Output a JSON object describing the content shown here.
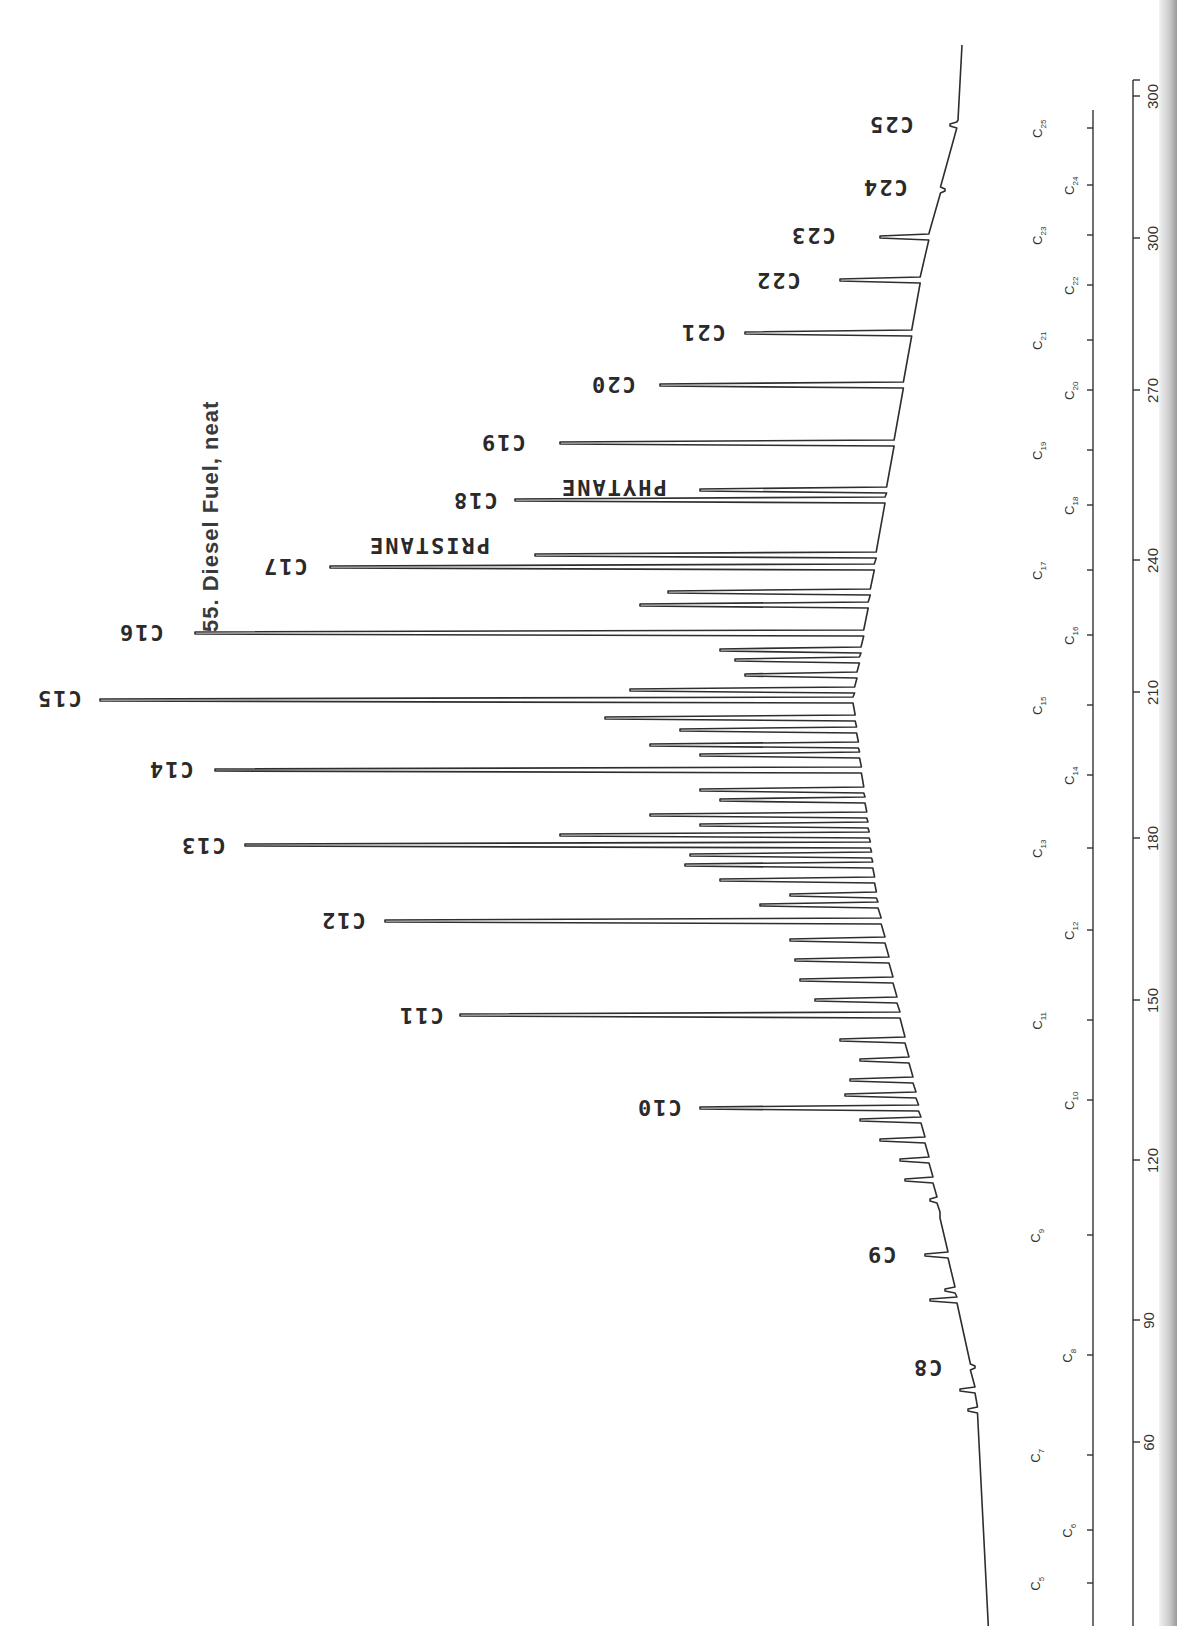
{
  "chart_data": {
    "type": "line",
    "title": "55. Diesel Fuel, neat",
    "orientation": "rotated 90° — retention axis runs vertically (bottom=early, top=late), detector response extends leftward",
    "xlabel": "Column temperature (°C) / carbon number",
    "ylabel": "Detector response",
    "temperature_ticks": [
      60,
      90,
      120,
      150,
      180,
      210,
      240,
      270,
      300,
      300
    ],
    "carbon_number_ticks": [
      "C5",
      "C6",
      "C7",
      "C8",
      "C9",
      "C10",
      "C11",
      "C12",
      "C13",
      "C14",
      "C15",
      "C16",
      "C17",
      "C18",
      "C19",
      "C20",
      "C21",
      "C22",
      "C23",
      "C24",
      "C25"
    ],
    "peaks": [
      {
        "label": "C8",
        "retention_temp": 83,
        "relative_height": 3
      },
      {
        "label": "C9",
        "retention_temp": 104,
        "relative_height": 8
      },
      {
        "label": "C10",
        "retention_temp": 124,
        "relative_height": 30
      },
      {
        "label": "C11",
        "retention_temp": 145,
        "relative_height": 56
      },
      {
        "label": "C12",
        "retention_temp": 164,
        "relative_height": 68
      },
      {
        "label": "C13",
        "retention_temp": 181,
        "relative_height": 82
      },
      {
        "label": "C14",
        "retention_temp": 196,
        "relative_height": 85
      },
      {
        "label": "C15",
        "retention_temp": 211,
        "relative_height": 100
      },
      {
        "label": "C16",
        "retention_temp": 225,
        "relative_height": 90
      },
      {
        "label": "C17",
        "retention_temp": 238,
        "relative_height": 72
      },
      {
        "label": "PRISTANE",
        "retention_temp": 240,
        "relative_height": 50
      },
      {
        "label": "C18",
        "retention_temp": 251,
        "relative_height": 48
      },
      {
        "label": "PHYTANE",
        "retention_temp": 253,
        "relative_height": 22
      },
      {
        "label": "C19",
        "retention_temp": 263,
        "relative_height": 43
      },
      {
        "label": "C20",
        "retention_temp": 275,
        "relative_height": 33
      },
      {
        "label": "C21",
        "retention_temp": 286,
        "relative_height": 22
      },
      {
        "label": "C22",
        "retention_temp": 297,
        "relative_height": 12
      },
      {
        "label": "C23",
        "retention_temp": 300,
        "relative_height": 7
      },
      {
        "label": "C24",
        "retention_temp": 300,
        "relative_height": 2
      },
      {
        "label": "C25",
        "retention_temp": 300,
        "relative_height": 1
      }
    ],
    "grid": false,
    "legend": null
  },
  "title": "55. Diesel Fuel, neat",
  "peak_labels": {
    "c8": "C8",
    "c9": "C9",
    "c10": "C10",
    "c11": "C11",
    "c12": "C12",
    "c13": "C13",
    "c14": "C14",
    "c15": "C15",
    "c16": "C16",
    "c17": "C17",
    "c18": "C18",
    "c19": "C19",
    "c20": "C20",
    "c21": "C21",
    "c22": "C22",
    "c23": "C23",
    "c24": "C24",
    "c25": "C25",
    "pristane": "PRISTANE",
    "phytane": "PHYTANE"
  },
  "carbon_axis": [
    {
      "sub": "5",
      "y": 1583,
      "col": "a"
    },
    {
      "sub": "6",
      "y": 1530,
      "col": "b"
    },
    {
      "sub": "7",
      "y": 1455,
      "col": "a"
    },
    {
      "sub": "8",
      "y": 1355,
      "col": "b"
    },
    {
      "sub": "9",
      "y": 1235,
      "col": "a"
    },
    {
      "sub": "10",
      "y": 1100,
      "col": "b"
    },
    {
      "sub": "11",
      "y": 1020,
      "col": "a"
    },
    {
      "sub": "12",
      "y": 930,
      "col": "b"
    },
    {
      "sub": "13",
      "y": 848,
      "col": "a"
    },
    {
      "sub": "14",
      "y": 775,
      "col": "b"
    },
    {
      "sub": "15",
      "y": 705,
      "col": "a"
    },
    {
      "sub": "16",
      "y": 635,
      "col": "b"
    },
    {
      "sub": "17",
      "y": 570,
      "col": "a"
    },
    {
      "sub": "18",
      "y": 505,
      "col": "b"
    },
    {
      "sub": "19",
      "y": 450,
      "col": "a"
    },
    {
      "sub": "20",
      "y": 390,
      "col": "b"
    },
    {
      "sub": "21",
      "y": 340,
      "col": "a"
    },
    {
      "sub": "22",
      "y": 285,
      "col": "b"
    },
    {
      "sub": "23",
      "y": 235,
      "col": "a"
    },
    {
      "sub": "24",
      "y": 185,
      "col": "b"
    },
    {
      "sub": "25",
      "y": 128,
      "col": "a"
    }
  ],
  "temp_axis": [
    {
      "label": "60",
      "y": 1442
    },
    {
      "label": "90",
      "y": 1320
    },
    {
      "label": "120",
      "y": 1160
    },
    {
      "label": "150",
      "y": 1000
    },
    {
      "label": "180",
      "y": 838
    },
    {
      "label": "210",
      "y": 692
    },
    {
      "label": "240",
      "y": 560
    },
    {
      "label": "270",
      "y": 390
    },
    {
      "label": "300",
      "y": 238
    },
    {
      "label": "300",
      "y": 96
    }
  ]
}
